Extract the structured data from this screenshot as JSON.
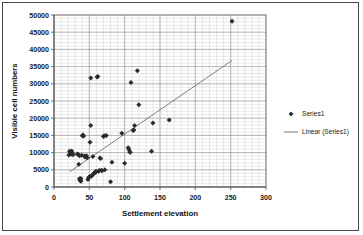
{
  "chart_data": {
    "type": "scatter",
    "title": "",
    "xlabel": "Settlement elevation",
    "ylabel": "Visible cell numbers",
    "xlim": [
      0,
      300
    ],
    "ylim": [
      0,
      50000
    ],
    "xticks": [
      "0",
      "50",
      "100",
      "150",
      "200",
      "250",
      "300"
    ],
    "yticks": [
      "0",
      "5000",
      "10000",
      "15000",
      "20000",
      "25000",
      "30000",
      "35000",
      "40000",
      "45000",
      "50000"
    ],
    "xtick_values": [
      0,
      50,
      100,
      150,
      200,
      250,
      300
    ],
    "ytick_values": [
      0,
      5000,
      10000,
      15000,
      20000,
      25000,
      30000,
      35000,
      40000,
      45000,
      50000
    ],
    "x_minor_per_major": 5,
    "y_minor_per_major": 5,
    "grid": true,
    "grid_axes": "both",
    "legend_position": "right",
    "legend": [
      {
        "label": "Series1",
        "marker": "diamond",
        "color": "#2b2b2b"
      },
      {
        "label": "Linear (Series1)",
        "marker": "line",
        "color": "#555555"
      }
    ],
    "series": [
      {
        "name": "Series1",
        "marker": "diamond",
        "color": "#2b2b2b",
        "points": [
          [
            21,
            9300
          ],
          [
            22,
            10400
          ],
          [
            23,
            10100
          ],
          [
            24,
            9500
          ],
          [
            25,
            10500
          ],
          [
            26,
            9900
          ],
          [
            27,
            9400
          ],
          [
            33,
            9600
          ],
          [
            34,
            9500
          ],
          [
            35,
            6600
          ],
          [
            36,
            9100
          ],
          [
            36,
            2400
          ],
          [
            37,
            1900
          ],
          [
            37,
            2100
          ],
          [
            38,
            1700
          ],
          [
            38,
            2500
          ],
          [
            39,
            9200
          ],
          [
            40,
            14900
          ],
          [
            41,
            15100
          ],
          [
            42,
            14800
          ],
          [
            43,
            9000
          ],
          [
            44,
            8700
          ],
          [
            45,
            8900
          ],
          [
            46,
            9100
          ],
          [
            47,
            8500
          ],
          [
            48,
            2200
          ],
          [
            49,
            2700
          ],
          [
            50,
            3000
          ],
          [
            51,
            13000
          ],
          [
            52,
            31700
          ],
          [
            52,
            17900
          ],
          [
            53,
            3100
          ],
          [
            54,
            3500
          ],
          [
            55,
            8900
          ],
          [
            56,
            3800
          ],
          [
            57,
            4100
          ],
          [
            58,
            4200
          ],
          [
            59,
            4500
          ],
          [
            60,
            4400
          ],
          [
            61,
            32000
          ],
          [
            62,
            32100
          ],
          [
            63,
            4600
          ],
          [
            64,
            4800
          ],
          [
            65,
            8400
          ],
          [
            66,
            8300
          ],
          [
            67,
            4900
          ],
          [
            68,
            4700
          ],
          [
            70,
            14700
          ],
          [
            71,
            14900
          ],
          [
            72,
            5000
          ],
          [
            74,
            15000
          ],
          [
            80,
            1500
          ],
          [
            82,
            7200
          ],
          [
            96,
            15600
          ],
          [
            100,
            6900
          ],
          [
            105,
            11400
          ],
          [
            106,
            10900
          ],
          [
            107,
            10200
          ],
          [
            108,
            10100
          ],
          [
            109,
            30400
          ],
          [
            112,
            16400
          ],
          [
            113,
            16600
          ],
          [
            114,
            17900
          ],
          [
            118,
            33800
          ],
          [
            120,
            23900
          ],
          [
            138,
            10400
          ],
          [
            140,
            18600
          ],
          [
            163,
            19500
          ],
          [
            252,
            48200
          ]
        ]
      }
    ],
    "trendline": {
      "name": "Linear (Series1)",
      "color": "#555555",
      "x_start": 22,
      "y_start": 4400,
      "x_end": 252,
      "y_end": 36800
    }
  }
}
